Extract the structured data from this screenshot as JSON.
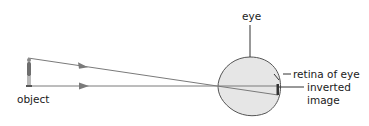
{
  "diagram": {
    "type": "ray-diagram",
    "labels": {
      "eye": "eye",
      "retina": "retina of eye",
      "inverted_image_line1": "inverted",
      "inverted_image_line2": "image",
      "object": "object"
    },
    "colors": {
      "ray": "#7a7a7a",
      "eye_fill": "#e6e6e6",
      "eye_stroke": "#555555",
      "leader": "#333333",
      "image_mark": "#333333",
      "text": "#1a1a1a"
    },
    "rays": [
      {
        "name": "ray-from-top-of-object",
        "from": [
          28,
          58
        ],
        "to": [
          278,
          95
        ],
        "arrow_at": [
          83,
          66
        ]
      },
      {
        "name": "ray-from-bottom-of-object",
        "from": [
          30,
          86
        ],
        "to": [
          278,
          86
        ],
        "arrow_at": [
          83,
          86
        ]
      }
    ]
  }
}
